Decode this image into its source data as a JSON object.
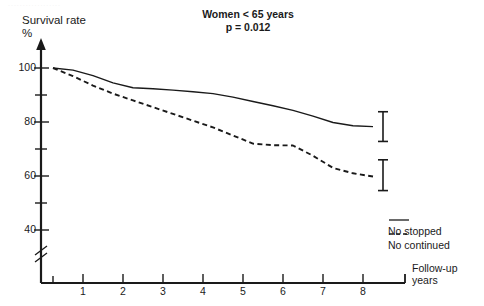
{
  "figure": {
    "top_fragment": "..................",
    "title": "Women < 65 years",
    "subtitle": "p = 0.012",
    "ylabel_line1": "Survival rate",
    "ylabel_line2": "%",
    "xlabel_line1": "Follow-up",
    "xlabel_line2": "years"
  },
  "chart_data": {
    "type": "line",
    "title": "Women < 65 years",
    "subtitle": "p = 0.012",
    "xlabel": "Follow-up years",
    "ylabel": "Survival rate %",
    "xlim": [
      0,
      8
    ],
    "ylim": [
      35,
      103
    ],
    "xticks": [
      1,
      2,
      3,
      4,
      5,
      6,
      7,
      8
    ],
    "xticklabels": [
      "1",
      "2",
      "3",
      "4",
      "5",
      "6",
      "7",
      "8"
    ],
    "yticks": [
      40,
      60,
      80,
      100
    ],
    "yticklabels": [
      "40",
      "60",
      "80",
      "100"
    ],
    "yminorticks": [
      50,
      70,
      90
    ],
    "y_axis_break": true,
    "grid": false,
    "legend_position": "lower right",
    "series": [
      {
        "name": "No stopped",
        "style": "solid",
        "color": "#1a1a1a",
        "x": [
          0,
          0.5,
          1,
          1.5,
          2,
          2.5,
          3,
          3.5,
          4,
          4.5,
          5,
          5.5,
          6,
          6.5,
          7,
          7.5,
          8
        ],
        "y": [
          100,
          99.2,
          97.2,
          94.5,
          92.7,
          92.3,
          91.8,
          91.2,
          90.5,
          89.2,
          87.6,
          86.0,
          84.3,
          82.2,
          79.8,
          78.6,
          78.3
        ],
        "errorbar": {
          "x": 8,
          "value": 78.3,
          "lower": 72.8,
          "upper": 83.8
        }
      },
      {
        "name": "No continued",
        "style": "dashed",
        "color": "#1a1a1a",
        "x": [
          0,
          0.5,
          1,
          1.5,
          2,
          2.5,
          3,
          3.5,
          4,
          4.5,
          5,
          5.5,
          6,
          6.5,
          7,
          7.5,
          8
        ],
        "y": [
          100,
          97.0,
          93.5,
          90.5,
          88.0,
          85.5,
          83.0,
          80.5,
          78.0,
          75.0,
          72.0,
          71.4,
          71.3,
          67.5,
          63.0,
          61.0,
          59.8
        ],
        "errorbar": {
          "x": 8,
          "value": 59.8,
          "lower": 54.6,
          "upper": 66.0
        }
      }
    ]
  },
  "legend": {
    "items": [
      {
        "label": "No stopped",
        "style": "solid"
      },
      {
        "label": "No continued",
        "style": "dashed"
      }
    ]
  }
}
